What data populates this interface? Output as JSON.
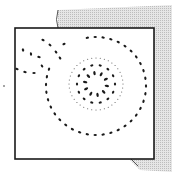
{
  "figure": {
    "colors": {
      "ink": "#1a1a1a",
      "backing": "#d9d9d9",
      "frame_fill": "#ffffff"
    },
    "elements": {
      "outer_ring_dots": 34,
      "inner_ring_dots": 14,
      "center_cluster_dots": 10,
      "fine_halo_dots": 40,
      "trail_dots": 12
    }
  }
}
